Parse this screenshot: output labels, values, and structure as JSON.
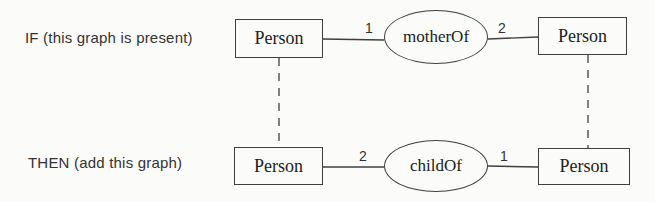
{
  "colors": {
    "background": "#fbfbf9",
    "line": "#3f3f3f",
    "text": "#222222"
  },
  "rule": {
    "if": {
      "label": "IF (this graph is present)",
      "left_node": "Person",
      "right_node": "Person",
      "relation": "motherOf",
      "left_cardinality": "1",
      "right_cardinality": "2"
    },
    "then": {
      "label": "THEN (add this graph)",
      "left_node": "Person",
      "right_node": "Person",
      "relation": "childOf",
      "left_cardinality": "2",
      "right_cardinality": "1"
    }
  }
}
